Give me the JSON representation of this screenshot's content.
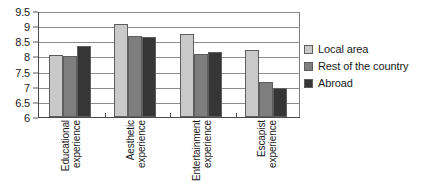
{
  "chart_data": {
    "type": "bar",
    "title": "",
    "subtitle": "",
    "xlabel": "",
    "ylabel": "",
    "ylim": [
      6,
      9.5
    ],
    "y_ticks": [
      "6",
      "6.5",
      "7",
      "7.5",
      "8",
      "8.5",
      "9",
      "9.5"
    ],
    "y_tick_values": [
      6,
      6.5,
      7,
      7.5,
      8,
      8.5,
      9,
      9.5
    ],
    "grid": true,
    "legend_position": "right",
    "categories": [
      "Educational experience",
      "Aesthetic experience",
      "Entertainment experience",
      "Escapist experience"
    ],
    "category_lines": [
      [
        "Educational",
        "experience"
      ],
      [
        "Aesthetic",
        "experience"
      ],
      [
        "Entertainment",
        "experience"
      ],
      [
        "Escapist",
        "experience"
      ]
    ],
    "series": [
      {
        "name": "Local area",
        "color": "#c9c9c9",
        "values": [
          8.05,
          9.08,
          8.73,
          8.2
        ]
      },
      {
        "name": "Rest of the country",
        "color": "#7e7e7e",
        "values": [
          8.0,
          8.68,
          8.08,
          7.15
        ]
      },
      {
        "name": "Abroad",
        "color": "#363636",
        "values": [
          8.35,
          8.65,
          8.16,
          6.95
        ]
      }
    ]
  },
  "legend": {
    "items": [
      {
        "label": "Local area",
        "color": "#c9c9c9"
      },
      {
        "label": "Rest of the country",
        "color": "#7e7e7e"
      },
      {
        "label": "Abroad",
        "color": "#363636"
      }
    ]
  }
}
